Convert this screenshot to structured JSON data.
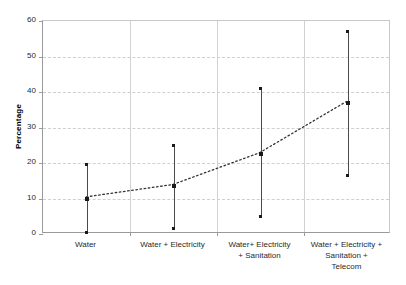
{
  "chart_data": {
    "type": "scatter",
    "title": "",
    "xlabel": "",
    "ylabel": "Percentage",
    "ylim": [
      0,
      60
    ],
    "yticks": [
      0,
      10,
      20,
      30,
      40,
      50,
      60
    ],
    "grid": true,
    "legend": "none",
    "categories": [
      "Water",
      "Water + Electricity",
      "Water+ Electricity\n+ Sanitation",
      "Water + Electricity +\nSanitation +\nTelecom"
    ],
    "series": [
      {
        "name": "Mean percentage",
        "values": [
          10,
          13.5,
          22.5,
          37
        ],
        "style": "dotted-line-with-markers"
      },
      {
        "name": "Lower bound",
        "values": [
          0.5,
          1.5,
          5,
          16.5
        ]
      },
      {
        "name": "Upper bound",
        "values": [
          19.5,
          25,
          41,
          57
        ]
      }
    ],
    "error_bars": [
      {
        "category": "Water",
        "mean": 10,
        "low": 0.5,
        "high": 19.5
      },
      {
        "category": "Water + Electricity",
        "mean": 13.5,
        "low": 1.5,
        "high": 25
      },
      {
        "category": "Water+ Electricity + Sanitation",
        "mean": 22.5,
        "low": 5,
        "high": 41
      },
      {
        "category": "Water + Electricity + Sanitation + Telecom",
        "mean": 37,
        "low": 16.5,
        "high": 57
      }
    ],
    "colors": {
      "marker": "#1a1a1a",
      "errorbar": "#4a4a4a",
      "trendline": "#333333",
      "gridline": "#cfcfcf",
      "axis": "#9a9a9a",
      "background": "#ffffff"
    }
  },
  "axis": {
    "y_tick_labels": [
      "0",
      "10",
      "20",
      "30",
      "40",
      "50",
      "60"
    ],
    "y_title": "Percentage",
    "x_tick_labels": [
      "Water",
      "Water + Electricity",
      "Water+ Electricity\n+ Sanitation",
      "Water + Electricity +\nSanitation +\nTelecom"
    ]
  }
}
